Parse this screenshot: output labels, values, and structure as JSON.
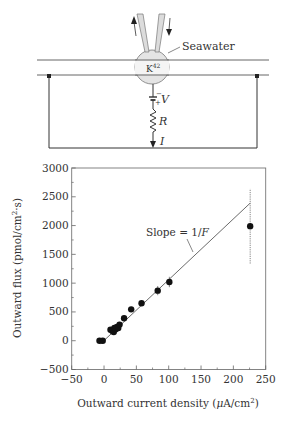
{
  "diagram": {
    "seawater_label": "Seawater",
    "isotope_label": "K",
    "isotope_superscript": "42",
    "voltage_label": "V",
    "voltage_minus": "−",
    "voltage_plus": "+",
    "resistance_label": "R",
    "current_label": "I"
  },
  "chart_data": {
    "type": "scatter",
    "title": "",
    "xlabel": "Outward current density (μA/cm²)",
    "xlabel_parts": {
      "pre": "Outward current density (",
      "mu": "μ",
      "mid": "A/cm",
      "sup": "2",
      "post": ")"
    },
    "ylabel": "Outward flux (pmol/cm²·s)",
    "ylabel_parts": {
      "pre": "Outward flux (pmol/cm",
      "sup": "2",
      "post": "·s)"
    },
    "xlim": [
      -50,
      250
    ],
    "ylim": [
      -500,
      3000
    ],
    "xticks": [
      -50,
      0,
      50,
      100,
      150,
      200,
      250
    ],
    "yticks": [
      -500,
      0,
      500,
      1000,
      1500,
      2000,
      2500,
      3000
    ],
    "xtick_labels": [
      "−50",
      "0",
      "50",
      "100",
      "150",
      "200",
      "250"
    ],
    "ytick_labels": [
      "−500",
      "0",
      "500",
      "1000",
      "1500",
      "2000",
      "2500",
      "3000"
    ],
    "grid": false,
    "points": [
      {
        "x": -7,
        "y": 0
      },
      {
        "x": -2,
        "y": 0
      },
      {
        "x": 10,
        "y": 190
      },
      {
        "x": 13,
        "y": 170
      },
      {
        "x": 15,
        "y": 150
      },
      {
        "x": 16,
        "y": 220
      },
      {
        "x": 18,
        "y": 200
      },
      {
        "x": 20,
        "y": 240
      },
      {
        "x": 22,
        "y": 220
      },
      {
        "x": 24,
        "y": 280
      },
      {
        "x": 31,
        "y": 390
      },
      {
        "x": 42,
        "y": 545
      },
      {
        "x": 58,
        "y": 650
      },
      {
        "x": 83,
        "y": 870,
        "err": 80
      },
      {
        "x": 101,
        "y": 1020,
        "err": 90
      },
      {
        "x": 226,
        "y": 1990,
        "err": 650
      }
    ],
    "fit_line": {
      "x0": -5,
      "y0": -50,
      "x1": 226,
      "y1": 2390
    },
    "annotation": {
      "text_pre": "Slope = 1/",
      "text_it": "F",
      "x": 100,
      "y": 1950
    }
  }
}
